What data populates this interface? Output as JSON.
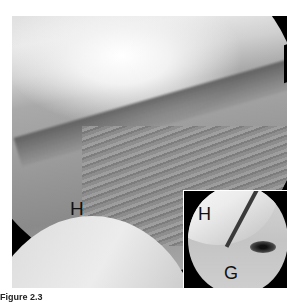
{
  "figure": {
    "main_image": {
      "description": "Arthroscopic view of shoulder joint",
      "labels": {
        "humeral_head": "H"
      }
    },
    "inset_image": {
      "labels": {
        "humeral_head": "H",
        "glenoid": "G"
      }
    },
    "caption": {
      "label": "Figure 2.3"
    }
  }
}
